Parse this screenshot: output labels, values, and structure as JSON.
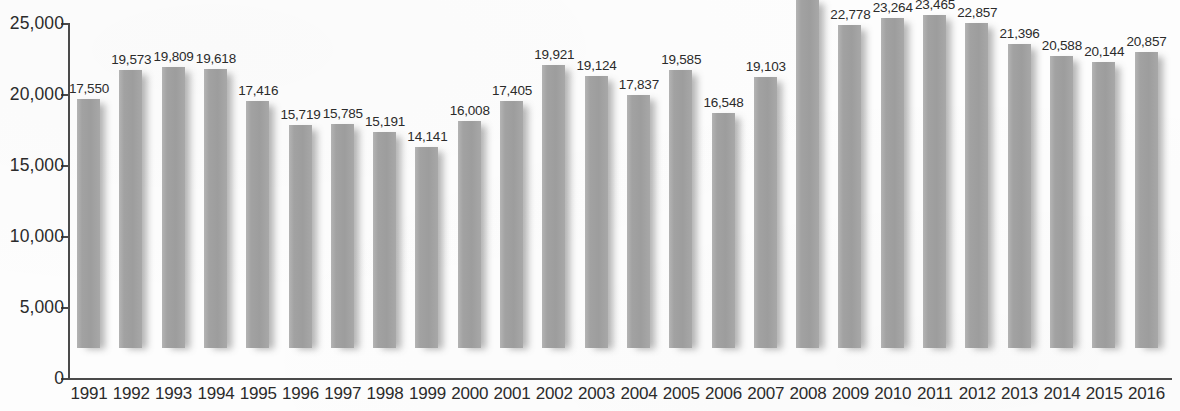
{
  "chart_data": {
    "type": "bar",
    "title": "",
    "subtitle": "",
    "xlabel": "",
    "ylabel": "",
    "ylim": [
      0,
      25000
    ],
    "ytick_labels": [
      "25,000",
      "20,000",
      "15,000",
      "10,000",
      "5,000",
      "0"
    ],
    "ytick_values": [
      25000,
      20000,
      15000,
      10000,
      5000,
      0
    ],
    "grid": false,
    "legend": null,
    "bar_color": "#a0a0a0",
    "axis_color": "#4a4a4a",
    "categories": [
      "1991",
      "1992",
      "1993",
      "1994",
      "1995",
      "1996",
      "1997",
      "1998",
      "1999",
      "2000",
      "2001",
      "2002",
      "2003",
      "2004",
      "2005",
      "2006",
      "2007",
      "2008",
      "2009",
      "2010",
      "2011",
      "2012",
      "2013",
      "2014",
      "2015",
      "2016"
    ],
    "values": [
      17550,
      19573,
      19809,
      19618,
      17416,
      15719,
      15785,
      15191,
      14141,
      16008,
      17405,
      19921,
      19124,
      17837,
      19585,
      16548,
      19103,
      24582,
      22778,
      23264,
      23465,
      22857,
      21396,
      20588,
      20144,
      20857
    ],
    "value_labels": [
      "17,550",
      "19,573",
      "19,809",
      "19,618",
      "17,416",
      "15,719",
      "15,785",
      "15,191",
      "14,141",
      "16,008",
      "17,405",
      "19,921",
      "19,124",
      "17,837",
      "19,585",
      "16,548",
      "19,103",
      "24,582",
      "22,778",
      "23,264",
      "23,465",
      "22,857",
      "21,396",
      "20,588",
      "20,144",
      "20,857"
    ]
  }
}
